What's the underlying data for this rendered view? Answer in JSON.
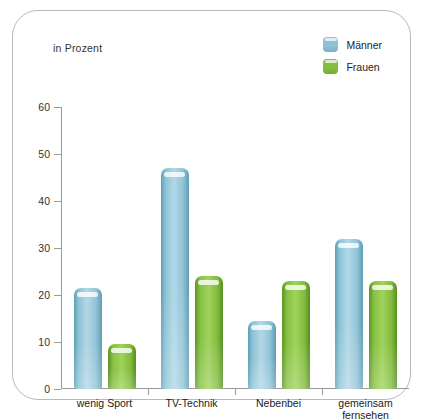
{
  "unit_label": "in Prozent",
  "legend": [
    {
      "label": "Männer",
      "color": "#8fc2d6"
    },
    {
      "label": "Frauen",
      "color": "#84be42"
    }
  ],
  "chart_data": {
    "type": "bar",
    "title": "",
    "subtitle": "",
    "xlabel": "",
    "ylabel": "in Prozent",
    "ylim": [
      0,
      60
    ],
    "yticks": [
      0,
      10,
      20,
      30,
      40,
      50,
      60
    ],
    "grid": false,
    "legend_position": "top-right",
    "categories": [
      "wenig Sport",
      "TV-Technik",
      "Nebenbei",
      "gemeinsam\nfernsehen"
    ],
    "series": [
      {
        "name": "Männer",
        "color": "#8fc2d6",
        "values": [
          21.5,
          47,
          14.5,
          32
        ]
      },
      {
        "name": "Frauen",
        "color": "#84be42",
        "values": [
          9.5,
          24,
          23,
          23
        ]
      }
    ]
  }
}
